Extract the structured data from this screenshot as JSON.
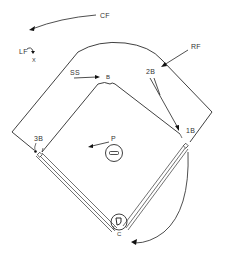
{
  "diagram": {
    "labels": {
      "cf": "CF",
      "rf": "RF",
      "lf": "LF",
      "lf_sub": "X",
      "ss": "SS",
      "second_base_marker": "B",
      "second_base": "2B",
      "third_base": "3B",
      "first_base": "1B",
      "pitcher": "P",
      "catcher": "C"
    },
    "colors": {
      "line": "#2a2a2a",
      "text": "#333333",
      "background": "#ffffff"
    }
  }
}
